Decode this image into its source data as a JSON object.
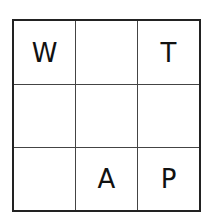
{
  "grid": {
    "rows": 3,
    "cols": 3,
    "cells": [
      [
        "W",
        "",
        "T"
      ],
      [
        "",
        "",
        ""
      ],
      [
        "",
        "A",
        "P"
      ]
    ]
  }
}
